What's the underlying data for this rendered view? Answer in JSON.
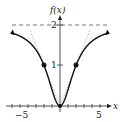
{
  "chart_data": {
    "type": "line",
    "title": "",
    "xlabel": "x",
    "ylabel": "f(x)",
    "function": "f(x) = 2x^2/(x^2+4)",
    "xlim": [
      -6,
      6
    ],
    "ylim": [
      0,
      2.2
    ],
    "x_ticks": [
      -5,
      5
    ],
    "y_ticks": [
      1,
      2
    ],
    "asymptote": {
      "y": 2,
      "style": "dashed"
    },
    "inflection_points": [
      {
        "x": -2,
        "y": 1
      },
      {
        "x": 2,
        "y": 1
      }
    ],
    "series": [
      {
        "name": "f(x)",
        "x": [
          -6,
          -5,
          -4,
          -3,
          -2,
          -1,
          0,
          1,
          2,
          3,
          4,
          5,
          6
        ],
        "values": [
          1.8,
          1.72,
          1.6,
          1.38,
          1.0,
          0.4,
          0,
          0.4,
          1.0,
          1.38,
          1.6,
          1.72,
          1.8
        ]
      }
    ],
    "grid": false,
    "legend": "none"
  },
  "labels": {
    "y_axis": "f(x)",
    "x_axis": "x",
    "tick_neg5": "−5",
    "tick_5": "5",
    "tick_1": "1",
    "tick_2": "2"
  }
}
